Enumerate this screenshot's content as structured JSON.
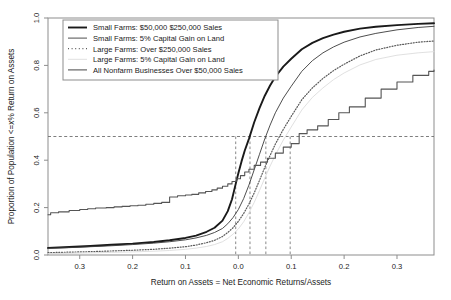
{
  "chart_data": {
    "type": "line",
    "title": "",
    "subtitle": "",
    "xlabel": "Return on Assets = Net Economic Returns/Assets",
    "ylabel": "Proportion of Population <=x% Return on Assets",
    "xlim": [
      -0.36,
      0.37
    ],
    "ylim": [
      0.0,
      1.0
    ],
    "grid": false,
    "legend_position": "top-left",
    "xticks": [
      -0.3,
      -0.2,
      -0.1,
      0.0,
      0.1,
      0.2,
      0.3
    ],
    "xticklabels": [
      "0.3",
      "0.2",
      "0.1",
      "0.0",
      "0.1",
      "0.2",
      "0.3"
    ],
    "yticks": [
      0.0,
      0.2,
      0.4,
      0.6,
      0.8,
      1.0
    ],
    "yticklabels": [
      "0.0",
      "0.2",
      "0.4",
      "0.6",
      "0.8",
      "1.0"
    ],
    "annotations": {
      "median_line_y": 0.5,
      "median_dropline_x": [
        -0.005,
        0.022,
        0.052,
        0.098
      ]
    },
    "series": [
      {
        "name": "Small Farms: $50,000  $250,000 Sales",
        "style": "solid-thick",
        "color": "#1a1a1a",
        "width": 1.9,
        "x": [
          -0.36,
          -0.32,
          -0.28,
          -0.24,
          -0.2,
          -0.16,
          -0.13,
          -0.1,
          -0.08,
          -0.06,
          -0.045,
          -0.03,
          -0.02,
          -0.012,
          -0.005,
          0.0,
          0.006,
          0.012,
          0.02,
          0.03,
          0.04,
          0.05,
          0.06,
          0.07,
          0.085,
          0.1,
          0.12,
          0.14,
          0.16,
          0.18,
          0.2,
          0.23,
          0.26,
          0.3,
          0.34,
          0.37
        ],
        "y": [
          0.03,
          0.034,
          0.038,
          0.043,
          0.048,
          0.055,
          0.062,
          0.072,
          0.082,
          0.098,
          0.115,
          0.145,
          0.185,
          0.235,
          0.3,
          0.345,
          0.395,
          0.44,
          0.49,
          0.56,
          0.62,
          0.672,
          0.715,
          0.752,
          0.795,
          0.828,
          0.868,
          0.895,
          0.915,
          0.93,
          0.942,
          0.955,
          0.963,
          0.97,
          0.975,
          0.978
        ]
      },
      {
        "name": "Small Farms: 5% Capital Gain on Land",
        "style": "solid-thin",
        "color": "#3a3a3a",
        "width": 0.9,
        "x": [
          -0.36,
          -0.32,
          -0.28,
          -0.24,
          -0.2,
          -0.16,
          -0.13,
          -0.1,
          -0.08,
          -0.06,
          -0.045,
          -0.03,
          -0.02,
          -0.01,
          0.0,
          0.01,
          0.02,
          0.03,
          0.04,
          0.05,
          0.06,
          0.07,
          0.085,
          0.1,
          0.12,
          0.14,
          0.16,
          0.18,
          0.2,
          0.23,
          0.26,
          0.3,
          0.34,
          0.37
        ],
        "y": [
          0.028,
          0.031,
          0.035,
          0.039,
          0.044,
          0.05,
          0.056,
          0.064,
          0.072,
          0.083,
          0.095,
          0.112,
          0.132,
          0.158,
          0.192,
          0.238,
          0.295,
          0.36,
          0.425,
          0.49,
          0.548,
          0.6,
          0.662,
          0.712,
          0.775,
          0.82,
          0.853,
          0.878,
          0.898,
          0.92,
          0.935,
          0.95,
          0.96,
          0.965
        ]
      },
      {
        "name": "Large Farms: Over $250,000 Sales",
        "style": "dotted",
        "color": "#5a5a5a",
        "width": 1.2,
        "x": [
          -0.36,
          -0.32,
          -0.28,
          -0.24,
          -0.2,
          -0.16,
          -0.13,
          -0.1,
          -0.08,
          -0.06,
          -0.045,
          -0.03,
          -0.02,
          -0.01,
          0.0,
          0.01,
          0.02,
          0.03,
          0.04,
          0.05,
          0.06,
          0.07,
          0.085,
          0.1,
          0.12,
          0.14,
          0.16,
          0.18,
          0.2,
          0.23,
          0.26,
          0.3,
          0.34,
          0.37
        ],
        "y": [
          0.01,
          0.012,
          0.014,
          0.017,
          0.02,
          0.024,
          0.029,
          0.035,
          0.042,
          0.052,
          0.062,
          0.078,
          0.095,
          0.115,
          0.142,
          0.175,
          0.215,
          0.262,
          0.315,
          0.37,
          0.42,
          0.468,
          0.53,
          0.585,
          0.655,
          0.705,
          0.745,
          0.778,
          0.805,
          0.84,
          0.865,
          0.885,
          0.898,
          0.903
        ]
      },
      {
        "name": "Large Farms: 5% Capital Gain on Land",
        "style": "solid-faint",
        "color": "#dcdcdc",
        "width": 0.9,
        "x": [
          -0.36,
          -0.32,
          -0.28,
          -0.24,
          -0.2,
          -0.16,
          -0.13,
          -0.1,
          -0.08,
          -0.06,
          -0.045,
          -0.03,
          -0.02,
          -0.01,
          0.0,
          0.01,
          0.02,
          0.03,
          0.04,
          0.05,
          0.06,
          0.07,
          0.085,
          0.1,
          0.12,
          0.14,
          0.16,
          0.18,
          0.2,
          0.23,
          0.26,
          0.3,
          0.34,
          0.37
        ],
        "y": [
          0.006,
          0.007,
          0.009,
          0.011,
          0.013,
          0.016,
          0.019,
          0.024,
          0.029,
          0.036,
          0.044,
          0.056,
          0.07,
          0.088,
          0.11,
          0.14,
          0.178,
          0.222,
          0.272,
          0.325,
          0.375,
          0.422,
          0.485,
          0.54,
          0.612,
          0.665,
          0.705,
          0.74,
          0.768,
          0.802,
          0.825,
          0.843,
          0.853,
          0.858
        ]
      },
      {
        "name": "All Nonfarm Businesses Over $50,000 Sales",
        "style": "step",
        "color": "#555555",
        "width": 1.1,
        "x": [
          -0.36,
          -0.355,
          -0.34,
          -0.32,
          -0.3,
          -0.285,
          -0.27,
          -0.25,
          -0.235,
          -0.22,
          -0.205,
          -0.19,
          -0.175,
          -0.16,
          -0.145,
          -0.13,
          -0.115,
          -0.1,
          -0.088,
          -0.075,
          -0.062,
          -0.05,
          -0.04,
          -0.03,
          -0.02,
          -0.012,
          -0.004,
          0.004,
          0.012,
          0.02,
          0.03,
          0.042,
          0.055,
          0.07,
          0.085,
          0.1,
          0.115,
          0.13,
          0.15,
          0.17,
          0.19,
          0.21,
          0.24,
          0.27,
          0.3,
          0.33,
          0.36,
          0.37
        ],
        "y": [
          0.17,
          0.178,
          0.182,
          0.188,
          0.192,
          0.195,
          0.198,
          0.2,
          0.203,
          0.205,
          0.208,
          0.21,
          0.214,
          0.218,
          0.222,
          0.245,
          0.25,
          0.253,
          0.256,
          0.262,
          0.268,
          0.275,
          0.282,
          0.29,
          0.3,
          0.31,
          0.322,
          0.335,
          0.35,
          0.362,
          0.378,
          0.392,
          0.408,
          0.43,
          0.455,
          0.47,
          0.512,
          0.528,
          0.545,
          0.572,
          0.6,
          0.625,
          0.662,
          0.7,
          0.73,
          0.758,
          0.775,
          0.78
        ]
      }
    ]
  },
  "legend": {
    "items": [
      {
        "label": "Small Farms: $50,000  $250,000 Sales"
      },
      {
        "label": "Small Farms: 5% Capital Gain on Land"
      },
      {
        "label": "Large Farms: Over $250,000 Sales"
      },
      {
        "label": "Large Farms: 5% Capital Gain on Land"
      },
      {
        "label": "All Nonfarm Businesses Over $50,000 Sales"
      }
    ]
  }
}
